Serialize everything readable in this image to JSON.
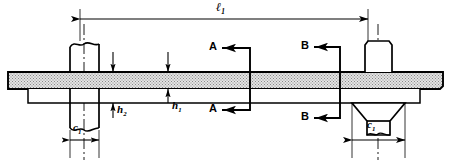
{
  "diagram": {
    "type": "engineering-cross-section",
    "width": 452,
    "height": 165,
    "background_color": "#ffffff",
    "line_color": "#000000",
    "plate_fill_color": "#d9d9d9",
    "component_fill_color": "#ffffff"
  },
  "labels": {
    "length_overall": {
      "symbol": "ℓ",
      "subscript": "1",
      "x": 222,
      "y": 8
    },
    "height_h2": {
      "symbol": "h",
      "subscript": "2",
      "x": 122,
      "y": 110
    },
    "height_h1": {
      "symbol": "h",
      "subscript": "1",
      "x": 178,
      "y": 106
    },
    "width_c1_left": {
      "symbol": "c",
      "subscript": "1",
      "x": 78,
      "y": 127
    },
    "width_c1_right": {
      "symbol": "c",
      "subscript": "1",
      "x": 372,
      "y": 124
    },
    "section_a_top": {
      "text": "A",
      "x": 213,
      "y": 43
    },
    "section_a_bottom": {
      "text": "A",
      "x": 213,
      "y": 105
    },
    "section_b_top": {
      "text": "B",
      "x": 305,
      "y": 42
    },
    "section_b_bottom": {
      "text": "B",
      "x": 305,
      "y": 113
    }
  },
  "dimensions": {
    "overall_length": {
      "name": "l1",
      "line_y": 19,
      "x_start": 80,
      "x_end": 368,
      "extension_top": 4,
      "extension_bottom": 45
    },
    "c1_left": {
      "name": "c1-left",
      "line_y": 140,
      "x_start": 70,
      "x_end": 99
    },
    "c1_right": {
      "name": "c1-right",
      "line_y": 140,
      "x_start": 352,
      "x_end": 405
    },
    "h1": {
      "name": "h1-plate-thickness",
      "x": 168,
      "y_top_arrow": 52,
      "y_plate_top": 72,
      "y_plate_bottom": 89,
      "y_bottom_arrow": 103
    },
    "h2": {
      "name": "h2-plate-plus-flange",
      "x": 113,
      "y_top_arrow": 52,
      "y_plate_top": 72,
      "y_flange_bottom": 103,
      "y_label_lead": 118
    }
  },
  "section_marks": {
    "a_a": {
      "name": "section-a-a",
      "cut_line_x": 250,
      "y_top": 48,
      "y_bottom": 110,
      "arrow_tip_x": 222,
      "arrow_tail_x": 250
    },
    "b_b": {
      "name": "section-b-b",
      "cut_line_x": 340,
      "y_top": 47,
      "y_bottom": 118,
      "arrow_tip_x": 314,
      "arrow_tail_x": 340
    }
  },
  "parts": {
    "main_plate": {
      "name": "main-plate",
      "x_left": 8,
      "x_right": 443,
      "y_top": 72,
      "y_bottom": 89
    },
    "lower_strip": {
      "name": "lower-flange-strip",
      "x_left": 28,
      "x_right": 420,
      "y_top": 91,
      "y_bottom": 103
    },
    "left_stud": {
      "name": "left-stud",
      "x_left": 70,
      "x_right": 99,
      "y_top": 42,
      "y_bottom": 132,
      "has_break_lines": true,
      "centerline_x": 84
    },
    "right_bolt_head": {
      "name": "right-bolt-head",
      "x_left": 365,
      "x_right": 392,
      "y_top": 41,
      "y_bottom": 72
    },
    "right_nut": {
      "name": "right-hex-nut",
      "x_left": 352,
      "x_right": 405,
      "y_top": 103,
      "y_bottom": 135,
      "chamfer_inset": 15,
      "centerline_x": 378
    }
  },
  "centerlines": {
    "left": {
      "name": "left-centerline",
      "x": 84,
      "y_top": 24,
      "y_bottom": 160
    },
    "right": {
      "name": "right-centerline",
      "x": 378,
      "y_top": 24,
      "y_bottom": 160
    }
  }
}
